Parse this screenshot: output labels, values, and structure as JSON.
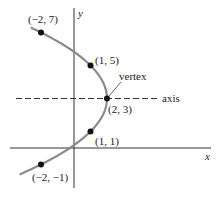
{
  "chart_data": {
    "type": "line",
    "title": "",
    "xlabel": "x",
    "ylabel": "y",
    "equation_shape": "horizontal parabola opening left, x = 2 - (y - 3)^2 / 4",
    "curve_color": "#8a8a8a",
    "point_color": "#111111",
    "points": [
      {
        "x": -2,
        "y": 7,
        "label": "(−2, 7)"
      },
      {
        "x": 1,
        "y": 5,
        "label": "(1, 5)"
      },
      {
        "x": 2,
        "y": 3,
        "label": "(2, 3)"
      },
      {
        "x": 1,
        "y": 1,
        "label": "(1, 1)"
      },
      {
        "x": -2,
        "y": -1,
        "label": "(−2, −1)"
      }
    ],
    "annotations": [
      {
        "text": "vertex",
        "target": [
          2,
          3
        ]
      },
      {
        "text": "axis",
        "describes": "dashed line y = 3 (axis of symmetry)"
      }
    ],
    "axis_of_symmetry": {
      "y": 3,
      "style": "dashed"
    },
    "grid": false,
    "legend": null
  },
  "labels": {
    "x_axis": "x",
    "y_axis": "y",
    "vertex": "vertex",
    "axis": "axis",
    "p1": "(−2, 7)",
    "p2": "(1, 5)",
    "p3": "(2, 3)",
    "p4": "(1, 1)",
    "p5": "(−2, −1)"
  }
}
